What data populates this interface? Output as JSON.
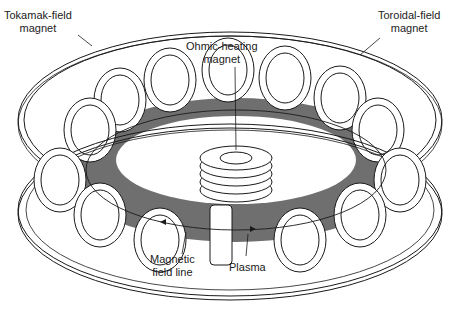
{
  "diagram": {
    "title": "Tokamak",
    "colors": {
      "line": "#1a1a1a",
      "plasma": "#6f6f6f",
      "fill": "#ffffff"
    },
    "labels": {
      "tokamak_field_magnet": {
        "line1": "Tokamak-field",
        "line2": "magnet"
      },
      "toroidal_field_magnet": {
        "line1": "Toroidal-field",
        "line2": "magnet"
      },
      "ohmic_heating_magnet": {
        "line1": "Ohmic-heating",
        "line2": "magnet"
      },
      "magnetic_field_line": {
        "line1": "Magnetic",
        "line2": "field line"
      },
      "plasma": {
        "line1": "Plasma"
      }
    }
  }
}
